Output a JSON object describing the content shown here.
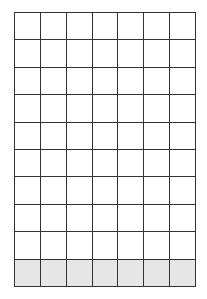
{
  "grid": {
    "columns": 7,
    "rows": 10,
    "shaded_rows": [
      9
    ],
    "colors": {
      "line": "#333333",
      "cell": "#ffffff",
      "shaded": "#e6e6e6"
    }
  }
}
